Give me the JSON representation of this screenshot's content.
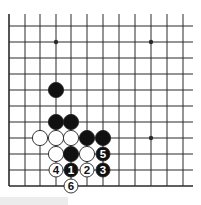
{
  "diagram": {
    "type": "go-board-fragment",
    "colors": {
      "line": "#2a2a2a",
      "black_stone": "#111111",
      "white_stone": "#ffffff",
      "stone_outline": "#222222",
      "background": "#ffffff"
    },
    "grid": {
      "columns_x": [
        9,
        25,
        40,
        56,
        71,
        87,
        103,
        119,
        135,
        151,
        167,
        183
      ],
      "rows_y": [
        26,
        42,
        58,
        74,
        90,
        106,
        122,
        138,
        154,
        170,
        186
      ],
      "top_open_y": 14,
      "right_open_x": 193,
      "left_edge": true,
      "bottom_edge": true
    },
    "star_points": [
      {
        "col": 3,
        "row": 1
      },
      {
        "col": 9,
        "row": 1
      },
      {
        "col": 9,
        "row": 7
      }
    ],
    "stones": [
      {
        "col": 3,
        "row": 4,
        "color": "black",
        "label": ""
      },
      {
        "col": 3,
        "row": 6,
        "color": "black",
        "label": ""
      },
      {
        "col": 4,
        "row": 6,
        "color": "black",
        "label": ""
      },
      {
        "col": 2,
        "row": 7,
        "color": "white",
        "label": ""
      },
      {
        "col": 3,
        "row": 7,
        "color": "white",
        "label": ""
      },
      {
        "col": 4,
        "row": 7,
        "color": "white",
        "label": ""
      },
      {
        "col": 5,
        "row": 7,
        "color": "black",
        "label": ""
      },
      {
        "col": 6,
        "row": 7,
        "color": "black",
        "label": ""
      },
      {
        "col": 3,
        "row": 8,
        "color": "white",
        "label": ""
      },
      {
        "col": 4,
        "row": 8,
        "color": "black",
        "label": ""
      },
      {
        "col": 5,
        "row": 8,
        "color": "white",
        "label": ""
      },
      {
        "col": 6,
        "row": 8,
        "color": "black",
        "label": "5"
      },
      {
        "col": 3,
        "row": 9,
        "color": "white",
        "label": "4"
      },
      {
        "col": 4,
        "row": 9,
        "color": "black",
        "label": "1"
      },
      {
        "col": 5,
        "row": 9,
        "color": "white",
        "label": "2"
      },
      {
        "col": 6,
        "row": 9,
        "color": "black",
        "label": "3"
      },
      {
        "col": 4,
        "row": 10,
        "color": "white",
        "label": "6"
      }
    ]
  }
}
